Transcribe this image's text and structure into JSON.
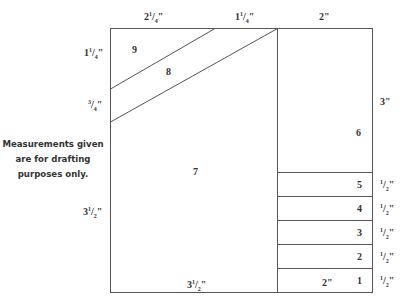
{
  "diagram": {
    "type": "quilt-block-drafting-diagram",
    "note": "Measurements given are for drafting purposes only.",
    "line_color": "#555555",
    "top_measurements": [
      {
        "id": "top-left-width",
        "whole": "2",
        "num": "1",
        "den": "4",
        "text": "2 1/4\""
      },
      {
        "id": "top-middle-width",
        "whole": "1",
        "num": "1",
        "den": "4",
        "text": "1 1/4\""
      },
      {
        "id": "top-right-width",
        "whole": "2",
        "num": "",
        "den": "",
        "text": "2\""
      }
    ],
    "left_measurements": [
      {
        "id": "left-top-height",
        "whole": "1",
        "num": "1",
        "den": "4",
        "text": "1 1/4\""
      },
      {
        "id": "left-middle-height",
        "whole": "",
        "num": "3",
        "den": "4",
        "text": "3/4\""
      },
      {
        "id": "left-bottom-height",
        "whole": "3",
        "num": "1",
        "den": "2",
        "text": "3 1/2\""
      }
    ],
    "right_measurements": [
      {
        "id": "right-6-height",
        "whole": "3",
        "num": "",
        "den": "",
        "text": "3\""
      },
      {
        "id": "right-5-height",
        "whole": "",
        "num": "1",
        "den": "2",
        "text": "1/2\""
      },
      {
        "id": "right-4-height",
        "whole": "",
        "num": "1",
        "den": "2",
        "text": "1/2\""
      },
      {
        "id": "right-3-height",
        "whole": "",
        "num": "1",
        "den": "2",
        "text": "1/2\""
      },
      {
        "id": "right-2-height",
        "whole": "",
        "num": "1",
        "den": "2",
        "text": "1/2\""
      },
      {
        "id": "right-1-height",
        "whole": "",
        "num": "1",
        "den": "2",
        "text": "1/2\""
      }
    ],
    "bottom_measurements": [
      {
        "id": "bottom-left-width",
        "whole": "3",
        "num": "1",
        "den": "2",
        "text": "3 1/2\""
      },
      {
        "id": "bottom-right-width",
        "whole": "2",
        "num": "",
        "den": "",
        "text": "2\""
      }
    ],
    "pieces": [
      "1",
      "2",
      "3",
      "4",
      "5",
      "6",
      "7",
      "8",
      "9"
    ]
  }
}
